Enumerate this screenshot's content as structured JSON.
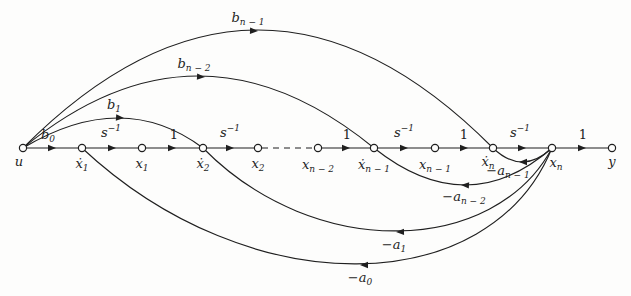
{
  "figure": {
    "kind": "signal-flow-graph",
    "colors": {
      "ink": "#1f1f1f",
      "background": "#fdfdfc"
    }
  },
  "nodes": [
    {
      "name": "u",
      "base": "u",
      "sub": ""
    },
    {
      "name": "x1-dot",
      "base": "ẋ",
      "sub": "1"
    },
    {
      "name": "x1",
      "base": "x",
      "sub": "1"
    },
    {
      "name": "x2-dot",
      "base": "ẋ",
      "sub": "2"
    },
    {
      "name": "x2",
      "base": "x",
      "sub": "2"
    },
    {
      "name": "xn-2",
      "base": "x",
      "sub": "n − 2"
    },
    {
      "name": "xn-1-dot",
      "base": "ẋ",
      "sub": "n − 1"
    },
    {
      "name": "xn-1",
      "base": "x",
      "sub": "n − 1"
    },
    {
      "name": "xn-dot",
      "base": "ẋ",
      "sub": "n"
    },
    {
      "name": "xn",
      "base": "x",
      "sub": "n"
    },
    {
      "name": "y",
      "base": "y",
      "sub": ""
    }
  ],
  "gains": {
    "b0": {
      "base": "b",
      "sub": "0"
    },
    "b1": {
      "base": "b",
      "sub": "1"
    },
    "bn2": {
      "base": "b",
      "sub": "n − 2"
    },
    "bn1": {
      "base": "b",
      "sub": "n − 1"
    },
    "a0": {
      "base": "−a",
      "sub": "0"
    },
    "a1": {
      "base": "−a",
      "sub": "1"
    },
    "an2": {
      "base": "−a",
      "sub": "n − 2"
    },
    "an1": {
      "base": "−a",
      "sub": "n − 1"
    },
    "integrator": {
      "base": "s",
      "sup": "−1"
    },
    "unity": {
      "base": "1"
    }
  }
}
